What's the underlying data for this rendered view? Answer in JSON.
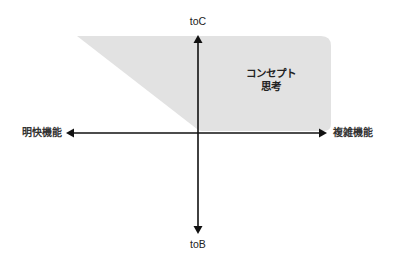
{
  "diagram": {
    "type": "quadrant",
    "axes": {
      "vertical": {
        "top_label": "toC",
        "bottom_label": "toB"
      },
      "horizontal": {
        "left_label": "明快機能",
        "right_label": "複雑機能"
      }
    },
    "regions": [
      {
        "name": "concept-thinking",
        "label_line1": "コンセプト",
        "label_line2": "思考",
        "fill_color": "#e2e2e2"
      }
    ],
    "colors": {
      "axis": "#111111",
      "region_fill": "#e2e2e2",
      "background": "#ffffff",
      "text": "#222222"
    }
  }
}
